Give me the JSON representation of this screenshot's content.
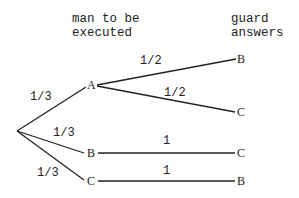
{
  "headers": {
    "col1": [
      "man to be",
      "executed"
    ],
    "col2": [
      "guard",
      "answers"
    ]
  },
  "tree": {
    "root": {
      "x": 17,
      "y": 131
    },
    "level1": [
      {
        "id": "A",
        "label": "A",
        "prob": "1/3",
        "x": 91,
        "y": 85
      },
      {
        "id": "B",
        "label": "B",
        "prob": "1/3",
        "x": 91,
        "y": 153
      },
      {
        "id": "C",
        "label": "C",
        "prob": "1/3",
        "x": 91,
        "y": 181
      }
    ],
    "level2": [
      {
        "parent": "A",
        "label": "B",
        "prob": "1/2",
        "x": 242,
        "y": 59
      },
      {
        "parent": "A",
        "label": "C",
        "prob": "1/2",
        "x": 241,
        "y": 112
      },
      {
        "parent": "B",
        "label": "C",
        "prob": "1",
        "x": 241,
        "y": 153
      },
      {
        "parent": "C",
        "label": "B",
        "prob": "1",
        "x": 241,
        "y": 181
      }
    ]
  }
}
